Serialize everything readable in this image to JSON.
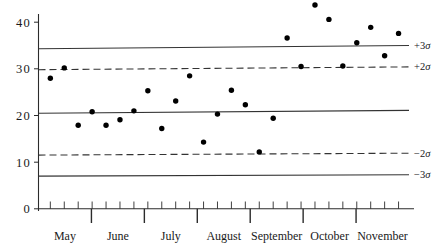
{
  "chart_data": {
    "type": "scatter",
    "title": "",
    "xlabel": "",
    "ylabel": "",
    "ylim": [
      0,
      44
    ],
    "yticks": [
      0,
      10,
      20,
      30,
      40
    ],
    "ytick_labels": [
      "0",
      "10",
      "20",
      "30",
      "40"
    ],
    "grid": false,
    "legend": false,
    "x_axis_type": "time-months",
    "categories": [
      "May",
      "June",
      "July",
      "August",
      "September",
      "October",
      "November"
    ],
    "series": [
      {
        "name": "observations",
        "marker": "filled-circle",
        "color": "#000000",
        "x": [
          0,
          1,
          2,
          3,
          4,
          5,
          6,
          7,
          8,
          9,
          10,
          11,
          12,
          13,
          14,
          15,
          16,
          17,
          18,
          19,
          20,
          21,
          22,
          23,
          24,
          25
        ],
        "values": [
          28.0,
          30.2,
          17.9,
          20.8,
          17.9,
          19.1,
          21.0,
          25.3,
          17.2,
          23.1,
          28.5,
          14.3,
          20.3,
          25.4,
          22.3,
          12.2,
          19.4,
          36.6,
          30.5,
          43.7,
          40.6,
          30.6,
          35.6,
          38.9,
          32.8,
          37.6
        ]
      }
    ],
    "control_lines": [
      {
        "id": "plus3sigma",
        "label": "+3σ",
        "style": "solid",
        "y_left": 34.3,
        "y_right": 35.0
      },
      {
        "id": "plus2sigma",
        "label": "+2σ",
        "style": "dashed",
        "y_left": 29.8,
        "y_right": 30.4
      },
      {
        "id": "center",
        "label": "",
        "style": "solid",
        "y_left": 20.5,
        "y_right": 21.1
      },
      {
        "id": "minus2sigma",
        "label": "−2σ",
        "style": "dashed",
        "y_left": 11.5,
        "y_right": 11.9
      },
      {
        "id": "minus3sigma",
        "label": "−3σ",
        "style": "solid",
        "y_left": 7.0,
        "y_right": 7.3
      }
    ],
    "sigma_labels": [
      "+3σ",
      "+2σ",
      "−2σ",
      "−3σ"
    ],
    "month_labels": [
      "May",
      "June",
      "July",
      "August",
      "September",
      "October",
      "November"
    ],
    "minor_tick_count": 26,
    "colors": {
      "axis": "#2b2b2b",
      "control_line": "#333333",
      "marker": "#000000",
      "background": "#ffffff"
    }
  },
  "axis": {
    "y_tick_labels": [
      "40",
      "30",
      "20",
      "10",
      "0"
    ],
    "x_month_labels": [
      "May",
      "June",
      "July",
      "August",
      "September",
      "October",
      "November"
    ]
  },
  "annotations": {
    "plus3": "+3",
    "plus2": "+2",
    "minus2": "−2",
    "minus3": "−3",
    "sigma_glyph": "σ"
  }
}
